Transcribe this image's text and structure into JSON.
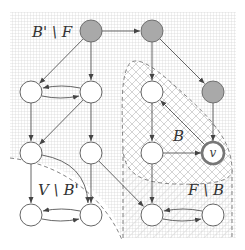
{
  "diagram": {
    "title": "",
    "regions": [
      {
        "id": "b-prime-minus-f",
        "label": "B' \\ F",
        "fill": "grid"
      },
      {
        "id": "v-minus-b-prime",
        "label": "V \\ B'",
        "fill": "none"
      },
      {
        "id": "b",
        "label": "B",
        "fill": "crosshatch"
      },
      {
        "id": "f-minus-b",
        "label": "F \\ B",
        "fill": "diagonal-hatch"
      }
    ],
    "nodes": [
      {
        "id": "n1",
        "style": "grey"
      },
      {
        "id": "n2",
        "style": "grey"
      },
      {
        "id": "n3",
        "style": "white"
      },
      {
        "id": "n4",
        "style": "white"
      },
      {
        "id": "n5",
        "style": "white"
      },
      {
        "id": "n6",
        "style": "grey"
      },
      {
        "id": "n7",
        "style": "white"
      },
      {
        "id": "n8",
        "style": "white"
      },
      {
        "id": "n9",
        "style": "white"
      },
      {
        "id": "v",
        "style": "double",
        "label": "v"
      },
      {
        "id": "n10",
        "style": "white"
      },
      {
        "id": "n11",
        "style": "white"
      },
      {
        "id": "n12",
        "style": "white"
      },
      {
        "id": "n13",
        "style": "white"
      }
    ],
    "edges": [
      {
        "from": "n1",
        "to": "n2"
      },
      {
        "from": "n1",
        "to": "n3"
      },
      {
        "from": "n1",
        "to": "n4"
      },
      {
        "from": "n2",
        "to": "n5"
      },
      {
        "from": "n2",
        "to": "n6"
      },
      {
        "from": "n3",
        "to": "n4"
      },
      {
        "from": "n4",
        "to": "n3"
      },
      {
        "from": "n3",
        "to": "n7"
      },
      {
        "from": "n4",
        "to": "n7"
      },
      {
        "from": "n4",
        "to": "n8"
      },
      {
        "from": "n5",
        "to": "n9"
      },
      {
        "from": "n6",
        "to": "v"
      },
      {
        "from": "v",
        "to": "n5"
      },
      {
        "from": "n9",
        "to": "v"
      },
      {
        "from": "n9",
        "to": "n12"
      },
      {
        "from": "n8",
        "to": "n12"
      },
      {
        "from": "n7",
        "to": "n10"
      },
      {
        "from": "n7",
        "to": "n11"
      },
      {
        "from": "n8",
        "to": "n11"
      },
      {
        "from": "n10",
        "to": "n11"
      },
      {
        "from": "n11",
        "to": "n10"
      },
      {
        "from": "n12",
        "to": "n13"
      },
      {
        "from": "n13",
        "to": "n12"
      }
    ],
    "colors": {
      "grey_node": "#a9a9a9",
      "stroke": "#555555",
      "dashed": "#777777",
      "grid": "#d8d8d8",
      "hatch": "#d0d0d0"
    }
  }
}
